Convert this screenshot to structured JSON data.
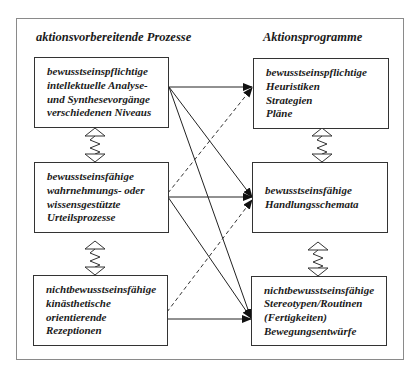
{
  "columns": {
    "left_title": "aktionsvorbereitende Prozesse",
    "right_title": "Aktionsprogramme"
  },
  "left_boxes": [
    {
      "lines": [
        "bewusstseinspflichtige",
        "intellektuelle Analyse-",
        "und Synthesevorgänge",
        "verschiedenen Niveaus"
      ]
    },
    {
      "lines": [
        "bewusstseinsfähige",
        "wahrnehmungs- oder",
        "wissensgestützte",
        "Urteilsprozesse"
      ]
    },
    {
      "lines": [
        "nichtbewusstseinsfähige",
        "kinästhetische",
        "orientierende",
        "Rezeptionen"
      ]
    }
  ],
  "right_boxes": [
    {
      "lines": [
        "bewusstseinspflichtige",
        "Heuristiken",
        "Strategien",
        "Pläne"
      ]
    },
    {
      "lines": [
        "bewusstseinsfähige",
        "Handlungsschemata"
      ]
    },
    {
      "lines": [
        "nichtbewusstseinsfähige",
        "Stereotypen/Routinen",
        "(Fertigkeiten)",
        "Bewegungsentwürfe"
      ]
    }
  ],
  "connections": [
    {
      "from": "left_1",
      "to": "right_1",
      "style": "solid"
    },
    {
      "from": "left_1",
      "to": "right_2",
      "style": "solid"
    },
    {
      "from": "left_1",
      "to": "right_3",
      "style": "solid"
    },
    {
      "from": "left_2",
      "to": "right_1",
      "style": "dashed"
    },
    {
      "from": "left_2",
      "to": "right_2",
      "style": "solid"
    },
    {
      "from": "left_2",
      "to": "right_3",
      "style": "solid"
    },
    {
      "from": "left_3",
      "to": "right_2",
      "style": "dashed"
    },
    {
      "from": "left_3",
      "to": "right_3",
      "style": "solid"
    }
  ],
  "vertical_links": [
    {
      "between": [
        "left_1",
        "left_2"
      ],
      "style": "zigzag-double-arrow"
    },
    {
      "between": [
        "left_2",
        "left_3"
      ],
      "style": "zigzag-double-arrow"
    },
    {
      "between": [
        "right_1",
        "right_2"
      ],
      "style": "zigzag-double-arrow"
    },
    {
      "between": [
        "right_2",
        "right_3"
      ],
      "style": "zigzag-double-arrow"
    }
  ]
}
